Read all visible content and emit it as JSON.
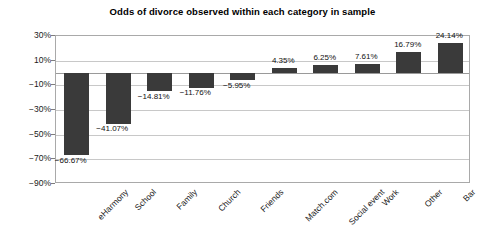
{
  "chart_data": {
    "type": "bar",
    "title": "Odds of divorce observed within each category in sample",
    "xlabel": "",
    "ylabel": "",
    "categories": [
      "eHarmony",
      "School",
      "Family",
      "Church",
      "Friends",
      "Match.com",
      "Social event",
      "Work",
      "Other",
      "Bar"
    ],
    "values": [
      -66.67,
      -41.07,
      -14.81,
      -11.76,
      -5.95,
      4.35,
      6.25,
      7.61,
      16.79,
      24.14
    ],
    "value_labels": [
      "-66.67%",
      "-41.07%",
      "-14.81%",
      "-11.76%",
      "-5.95%",
      "4.35%",
      "6.25%",
      "7.61%",
      "16.79%",
      "24.14%"
    ],
    "ylim": [
      -90,
      30
    ],
    "ytick_values": [
      30,
      10,
      -10,
      -30,
      -50,
      -70,
      -90
    ],
    "ytick_labels": [
      "30%",
      "10%",
      "-10%",
      "-30%",
      "-50%",
      "-70%",
      "-90%"
    ],
    "grid": true,
    "legend": "none",
    "series_color": "#3a3a3a",
    "gridline_color": "#c8c8c8",
    "axis_color": "#a9a9a9"
  }
}
